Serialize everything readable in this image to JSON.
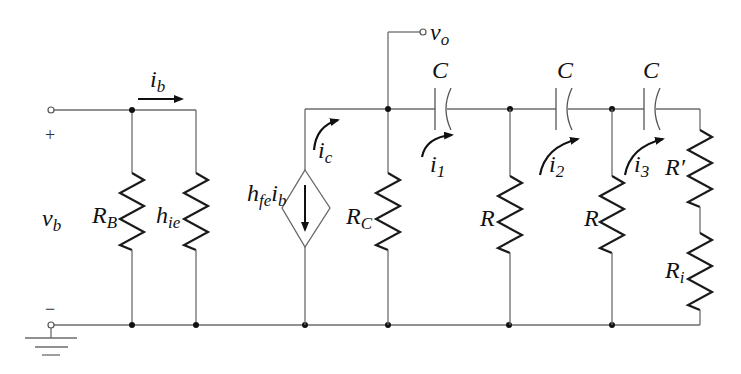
{
  "diagram": {
    "type": "small-signal equivalent circuit with RC phase-shift network",
    "colors": {
      "wire": "#6b6b6b",
      "component": "#1a1a1a",
      "background": "#ffffff"
    },
    "input": {
      "voltage_label": "v",
      "voltage_sub": "b",
      "plus": "+",
      "minus": "−",
      "current_label": "i",
      "current_sub": "b"
    },
    "components": {
      "RB": {
        "main": "R",
        "sub": "B"
      },
      "hie": {
        "main": "h",
        "sub": "ie"
      },
      "source": {
        "main1": "h",
        "sub1": "fe",
        "main2": "i",
        "sub2": "b"
      },
      "ic": {
        "main": "i",
        "sub": "c"
      },
      "RC": {
        "main": "R",
        "sub": "C"
      },
      "vo": {
        "main": "v",
        "sub": "o"
      },
      "C1": {
        "main": "C"
      },
      "C2": {
        "main": "C"
      },
      "C3": {
        "main": "C"
      },
      "i1": {
        "main": "i",
        "sub": "1"
      },
      "i2": {
        "main": "i",
        "sub": "2"
      },
      "i3": {
        "main": "i",
        "sub": "3"
      },
      "R1": {
        "main": "R"
      },
      "R2": {
        "main": "R"
      },
      "Rprime": {
        "main": "R′"
      },
      "Ri": {
        "main": "R",
        "sub": "i"
      }
    }
  }
}
